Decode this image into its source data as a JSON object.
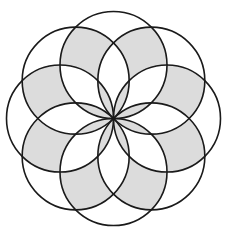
{
  "diagram": {
    "center": {
      "x": 113.5,
      "y": 118.5
    },
    "circle_count": 8,
    "circle_radius": 53.5,
    "angle_step_deg": 45,
    "colors": {
      "background": "#ffffff",
      "shade": "#dcdcdc",
      "stroke": "#1a1a1a"
    },
    "stroke_width": 1.6
  }
}
